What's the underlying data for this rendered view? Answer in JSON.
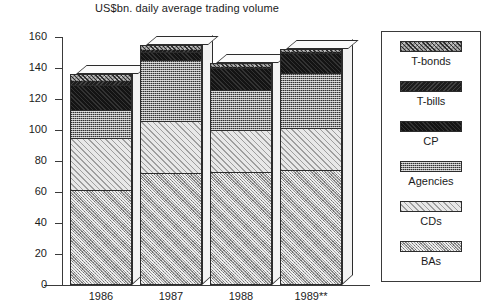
{
  "chart_data": {
    "type": "bar",
    "subtype": "stacked-3d-column",
    "title": "US$bn. daily average trading volume",
    "xlabel": "",
    "ylabel": "",
    "ylim": [
      0,
      160
    ],
    "ytick_step": 20,
    "yticks": [
      160,
      140,
      120,
      100,
      80,
      60,
      40,
      20,
      0
    ],
    "grid": false,
    "legend_position": "right",
    "categories": [
      "1986",
      "1987",
      "1988",
      "1989**"
    ],
    "series": [
      {
        "name": "BAs",
        "values": [
          61,
          72,
          73,
          74
        ]
      },
      {
        "name": "CDs",
        "values": [
          34,
          34,
          27,
          27
        ]
      },
      {
        "name": "Agencies",
        "values": [
          18,
          39,
          26,
          36
        ]
      },
      {
        "name": "CP",
        "values": [
          16,
          5,
          14,
          13
        ]
      },
      {
        "name": "T-bills",
        "values": [
          3,
          2,
          1,
          1
        ]
      },
      {
        "name": "T-bonds",
        "values": [
          4,
          3,
          2,
          1
        ]
      }
    ],
    "stack_order_bottom_to_top": [
      "BAs",
      "CDs",
      "Agencies",
      "CP",
      "T-bills",
      "T-bonds"
    ],
    "totals": [
      136,
      155,
      143,
      152
    ],
    "annotations": [
      "** denotes estimate/partial year"
    ]
  },
  "axis": {
    "y_tick_labels": [
      "160",
      "140",
      "120",
      "100",
      "80",
      "60",
      "40",
      "20",
      "0"
    ]
  },
  "legend": {
    "entries": [
      {
        "label": "T-bonds",
        "swatch": "tbonds",
        "pattern": "dark-diagonal-hatch"
      },
      {
        "label": "T-bills",
        "swatch": "tbills",
        "pattern": "solid-near-black"
      },
      {
        "label": "CP",
        "swatch": "cp",
        "pattern": "solid-black"
      },
      {
        "label": "Agencies",
        "swatch": "agencies",
        "pattern": "fine-checker"
      },
      {
        "label": "CDs",
        "swatch": "cds",
        "pattern": "light-diagonal-hatch"
      },
      {
        "label": "BAs",
        "swatch": "bas",
        "pattern": "mid-grey-crosshatch"
      }
    ]
  },
  "x_labels": [
    "1986",
    "1987",
    "1988",
    "1989**"
  ]
}
